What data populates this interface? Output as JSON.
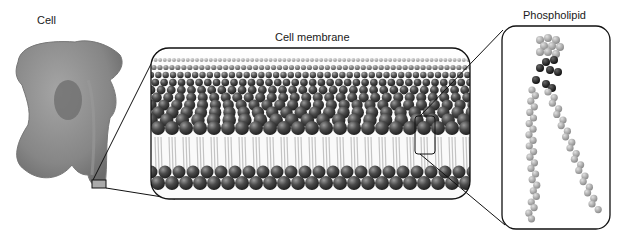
{
  "labels": {
    "cell": "Cell",
    "membrane": "Cell membrane",
    "phospholipid": "Phospholipid"
  },
  "colors": {
    "head": "#4a4a4a",
    "tail": "#bdbdbd",
    "cell_body": "#8a8a8a",
    "outline": "#222222"
  }
}
